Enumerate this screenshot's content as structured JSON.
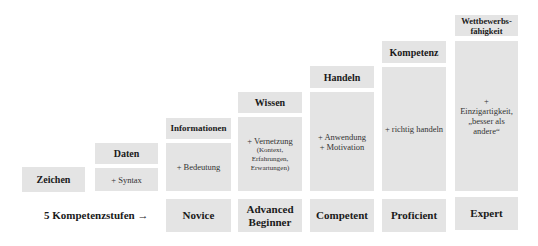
{
  "stairs": [
    {
      "header": "Zeichen",
      "body": ""
    },
    {
      "header": "Daten",
      "body": "+ Syntax"
    },
    {
      "header": "Informationen",
      "body": "+ Bedeutung"
    },
    {
      "header": "Wissen",
      "body": "+ Vernetzung",
      "body_detail": [
        "(Kontext,",
        "Erfahrungen,",
        "Erwartungen)"
      ]
    },
    {
      "header": "Handeln",
      "body_lines": [
        "+ Anwendung",
        "+ Motivation"
      ]
    },
    {
      "header": "Kompetenz",
      "body": "+ richtig handeln"
    },
    {
      "header_lines": [
        "Wettbewerbs-",
        "fähigkeit"
      ],
      "body_lines": [
        "+ Einzigartigkeit,",
        "„besser als",
        "andere“"
      ]
    }
  ],
  "levels": {
    "label": "5 Kompetenzstufen →",
    "items": [
      {
        "lines": [
          "Novice"
        ]
      },
      {
        "lines": [
          "Advanced",
          "Beginner"
        ]
      },
      {
        "lines": [
          "Competent"
        ]
      },
      {
        "lines": [
          "Proficient"
        ]
      },
      {
        "lines": [
          "Expert"
        ]
      }
    ]
  },
  "colors": {
    "box": "#e4e4e4",
    "background": "#ffffff"
  }
}
